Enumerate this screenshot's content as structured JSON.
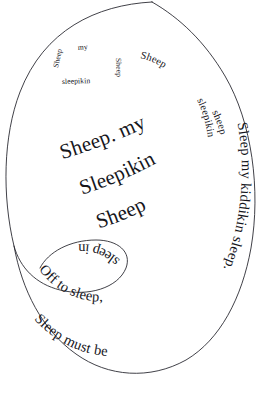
{
  "artwork": {
    "title": "Sheep, my Sleepikin Sheep",
    "background_color": "#ffffff",
    "ink_color": "#16161c",
    "stroke_color": "#2b2b33",
    "width": 261,
    "height": 401,
    "form": "typographic-spiral"
  },
  "spiral": {
    "name": "lullaby-spiral-curve",
    "description": "single open spiral curve with an inner loop at lower-left"
  },
  "rings": [
    {
      "index": 0,
      "size": "large",
      "segments": [
        {
          "id": "seg-0-0",
          "text": "Sheep. my"
        },
        {
          "id": "seg-0-1",
          "text": "Sleepikin"
        },
        {
          "id": "seg-0-2",
          "text": "Sheep"
        }
      ]
    },
    {
      "index": 1,
      "size": "medium",
      "segments": [
        {
          "id": "seg-1-0",
          "text": "Sleep my kiddikin sleep."
        },
        {
          "id": "seg-1-1",
          "text": "Sleep must be"
        },
        {
          "id": "seg-1-2",
          "text": "Off to sleep,"
        },
        {
          "id": "seg-1-3",
          "text": "sleep in"
        }
      ]
    },
    {
      "index": 2,
      "size": "small",
      "segments": [
        {
          "id": "seg-2-0",
          "text": "Sheep"
        },
        {
          "id": "seg-2-1",
          "text": "sleepikin"
        },
        {
          "id": "seg-2-2",
          "text": "sheep"
        }
      ]
    },
    {
      "index": 3,
      "size": "tiny",
      "segments": [
        {
          "id": "seg-3-0",
          "text": "Sheep"
        },
        {
          "id": "seg-3-1",
          "text": "my"
        },
        {
          "id": "seg-3-2",
          "text": "sleepikin"
        },
        {
          "id": "seg-3-3",
          "text": "Sheep"
        }
      ]
    }
  ]
}
